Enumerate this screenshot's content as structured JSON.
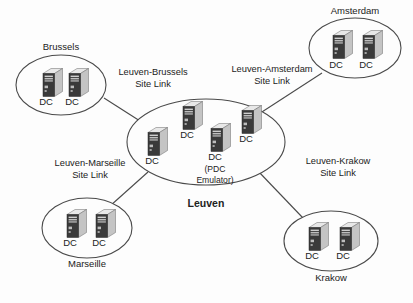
{
  "diagram": {
    "type": "network-site-topology",
    "background_color": "#fdfdfd",
    "line_color": "#4a4a4a",
    "dc_label": "DC",
    "sites": [
      {
        "id": "brussels",
        "name": "Brussels",
        "name_position": "above",
        "cx": 61,
        "cy": 85,
        "rx": 45,
        "ry": 30,
        "label_x": 61,
        "label_y": 50,
        "servers": [
          {
            "x": 40,
            "y": 68,
            "label": "DC",
            "label_x": 46,
            "label_y": 105
          },
          {
            "x": 66,
            "y": 68,
            "label": "DC",
            "label_x": 72,
            "label_y": 105
          }
        ]
      },
      {
        "id": "amsterdam",
        "name": "Amsterdam",
        "name_position": "above",
        "cx": 355,
        "cy": 48,
        "rx": 46,
        "ry": 30,
        "label_x": 355,
        "label_y": 14,
        "servers": [
          {
            "x": 330,
            "y": 30,
            "label": "DC",
            "label_x": 336,
            "label_y": 68
          },
          {
            "x": 360,
            "y": 30,
            "label": "DC",
            "label_x": 366,
            "label_y": 68
          }
        ]
      },
      {
        "id": "marseille",
        "name": "Marseille",
        "name_position": "below",
        "cx": 87,
        "cy": 228,
        "rx": 45,
        "ry": 30,
        "label_x": 87,
        "label_y": 267,
        "servers": [
          {
            "x": 64,
            "y": 209,
            "label": "DC",
            "label_x": 70,
            "label_y": 246
          },
          {
            "x": 93,
            "y": 209,
            "label": "DC",
            "label_x": 99,
            "label_y": 246
          }
        ]
      },
      {
        "id": "krakow",
        "name": "Krakow",
        "name_position": "below",
        "cx": 331,
        "cy": 241,
        "rx": 47,
        "ry": 30,
        "label_x": 331,
        "label_y": 281,
        "servers": [
          {
            "x": 306,
            "y": 222,
            "label": "DC",
            "label_x": 312,
            "label_y": 259
          },
          {
            "x": 337,
            "y": 222,
            "label": "DC",
            "label_x": 343,
            "label_y": 259
          }
        ]
      },
      {
        "id": "leuven",
        "name": "Leuven",
        "name_position": "below",
        "is_hub": true,
        "cx": 206,
        "cy": 142,
        "rx": 79,
        "ry": 43,
        "label_x": 206,
        "label_y": 207,
        "servers": [
          {
            "x": 145,
            "y": 127,
            "label": "DC",
            "label_x": 152,
            "label_y": 164
          },
          {
            "x": 180,
            "y": 101,
            "label": "DC",
            "label_x": 187,
            "label_y": 138
          },
          {
            "x": 239,
            "y": 105,
            "label": "DC",
            "label_x": 246,
            "label_y": 142
          },
          {
            "x": 208,
            "y": 123,
            "label": "DC",
            "label_x": 215,
            "label_y": 160,
            "sublabels": [
              "(PDC",
              "Emulator)"
            ],
            "sublabel_x": 215,
            "sublabel_y": 172
          }
        ]
      }
    ],
    "site_links": [
      {
        "id": "leuven-brussels",
        "line1": "Leuven-Brussels",
        "line2": "Site Link",
        "label_x": 153,
        "label_y": 75,
        "path": "M 104 98 L 140 121"
      },
      {
        "id": "leuven-amsterdam",
        "line1": "Leuven-Amsterdam",
        "line2": "Site Link",
        "label_x": 272,
        "label_y": 72,
        "path": "M 322 73 L 248 121"
      },
      {
        "id": "leuven-marseille",
        "line1": "Leuven-Marseille",
        "line2": "Site Link",
        "label_x": 90,
        "label_y": 166,
        "path": "M 110 206 L 148 172"
      },
      {
        "id": "leuven-krakow",
        "line1": "Leuven-Krakow",
        "line2": "Site Link",
        "label_x": 338,
        "label_y": 164,
        "path": "M 303 218 L 258 171"
      }
    ]
  }
}
